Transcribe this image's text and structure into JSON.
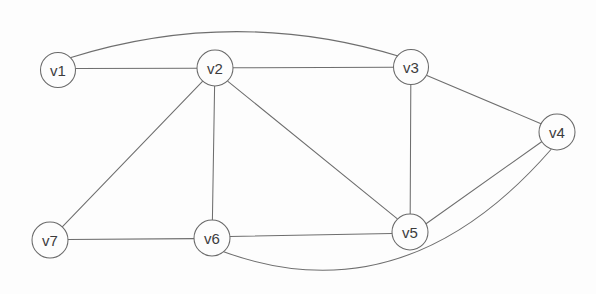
{
  "figure": {
    "name": "undirected-graph-diagram",
    "width": 596,
    "height": 294,
    "background_color": "#fdfdfd",
    "node_fill_color": "#fdfdfd",
    "node_stroke_color": "#6a6a6a",
    "edge_color": "#6e6e6e",
    "label_color": "#3c3c3c"
  },
  "graph": {
    "type": "undirected",
    "node_radius": 17.5,
    "nodes": [
      {
        "id": "v1",
        "label": "v1",
        "cx": 58,
        "cy": 70,
        "r": 17.5
      },
      {
        "id": "v2",
        "label": "v2",
        "cx": 215,
        "cy": 68,
        "r": 18.0
      },
      {
        "id": "v3",
        "label": "v3",
        "cx": 411,
        "cy": 67,
        "r": 17.5
      },
      {
        "id": "v4",
        "label": "v4",
        "cx": 557,
        "cy": 132,
        "r": 18.0
      },
      {
        "id": "v5",
        "label": "v5",
        "cx": 410,
        "cy": 232,
        "r": 18.0
      },
      {
        "id": "v6",
        "label": "v6",
        "cx": 212,
        "cy": 238,
        "r": 18.0
      },
      {
        "id": "v7",
        "label": "v7",
        "cx": 50,
        "cy": 240,
        "r": 18.0
      }
    ],
    "edges": [
      {
        "id": "e-v1-v2",
        "source": "v1",
        "target": "v2",
        "shape": "straight",
        "path": "M 75.5 68.6 L 197.0 68.2"
      },
      {
        "id": "e-v1-v3",
        "source": "v1",
        "target": "v3",
        "shape": "curved",
        "path": "M 71.0 57.5 Q 236.0 6.0 401.5 57.0"
      },
      {
        "id": "e-v2-v3",
        "source": "v2",
        "target": "v3",
        "shape": "straight",
        "path": "M 233.0 67.8 L 393.5 67.2"
      },
      {
        "id": "e-v2-v5",
        "source": "v2",
        "target": "v5",
        "shape": "straight",
        "path": "M 227.9 81.3 L 397.1 218.7"
      },
      {
        "id": "e-v2-v6",
        "source": "v2",
        "target": "v6",
        "shape": "straight",
        "path": "M 214.6 86.0 L 212.4 220.0"
      },
      {
        "id": "e-v2-v7",
        "source": "v2",
        "target": "v7",
        "shape": "straight",
        "path": "M 202.5 81.3 L 62.5 226.7"
      },
      {
        "id": "e-v3-v4",
        "source": "v3",
        "target": "v4",
        "shape": "straight",
        "path": "M 426.9 75.5 L 541.6 124.0"
      },
      {
        "id": "e-v3-v5",
        "source": "v3",
        "target": "v5",
        "shape": "straight",
        "path": "M 410.8 84.5 L 410.2 214.0"
      },
      {
        "id": "e-v4-v5",
        "source": "v4",
        "target": "v5",
        "shape": "straight",
        "path": "M 542.0 141.5 L 425.0 224.5"
      },
      {
        "id": "e-v4-v6",
        "source": "v4",
        "target": "v6",
        "shape": "curved",
        "path": "M 551.0 149.5 Q 404.0 318.0 223.0 251.5"
      },
      {
        "id": "e-v5-v6",
        "source": "v5",
        "target": "v6",
        "shape": "straight",
        "path": "M 392.0 233.5 L 230.0 236.5"
      },
      {
        "id": "e-v6-v7",
        "source": "v6",
        "target": "v7",
        "shape": "straight",
        "path": "M 194.0 238.6 L 68.0 239.4"
      }
    ],
    "adjacency_summary": {
      "v1": [
        "v2",
        "v3"
      ],
      "v2": [
        "v1",
        "v3",
        "v5",
        "v6",
        "v7"
      ],
      "v3": [
        "v1",
        "v2",
        "v4",
        "v5"
      ],
      "v4": [
        "v3",
        "v5",
        "v6"
      ],
      "v5": [
        "v2",
        "v3",
        "v4",
        "v6"
      ],
      "v6": [
        "v2",
        "v4",
        "v5",
        "v7"
      ],
      "v7": [
        "v2",
        "v6"
      ]
    }
  }
}
